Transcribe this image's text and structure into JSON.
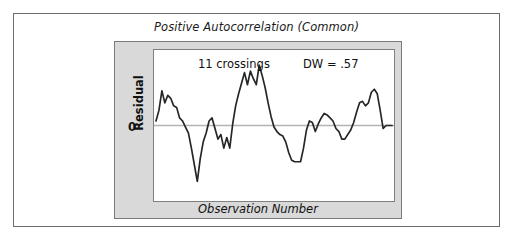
{
  "figure": {
    "title": "Positive Autocorrelation (Common)",
    "colors": {
      "panel_background": "#d9d9d9",
      "plot_background": "#ffffff",
      "frame_border": "#6d6d6d",
      "panel_border": "#7a7a7a",
      "plot_border": "#808080",
      "series_line": "#262626",
      "zero_line": "#b4b4b4",
      "text": "#111111"
    }
  },
  "annotations": {
    "crossings": "11 crossings",
    "durbin_watson": "DW = .57"
  },
  "axes": {
    "ylabel": "Residual",
    "xlabel": "Observation Number",
    "ytick_zero": "0"
  },
  "chart_data": {
    "type": "line",
    "title": "Positive Autocorrelation (Common)",
    "xlabel": "Observation Number",
    "ylabel": "Residual",
    "ytick_labels": [
      "0"
    ],
    "ylim": [
      -1.0,
      1.0
    ],
    "xlim": [
      0,
      80
    ],
    "grid": false,
    "legend": null,
    "zero_reference_line": 0,
    "annotations": [
      "11 crossings",
      "DW = .57"
    ],
    "series": [
      {
        "name": "Residual",
        "x": [
          0,
          1,
          2,
          3,
          4,
          5,
          6,
          7,
          8,
          9,
          10,
          11,
          12,
          13,
          14,
          15,
          16,
          17,
          18,
          19,
          20,
          21,
          22,
          23,
          24,
          25,
          26,
          27,
          28,
          29,
          30,
          31,
          32,
          33,
          34,
          35,
          36,
          37,
          38,
          39,
          40,
          41,
          42,
          43,
          44,
          45,
          46,
          47,
          48,
          49,
          50,
          51,
          52,
          53,
          54,
          55,
          56,
          57,
          58,
          59,
          60,
          61,
          62,
          63,
          64,
          65,
          66,
          67,
          68,
          69,
          70,
          71,
          72,
          73,
          74,
          75,
          76,
          77,
          78,
          79,
          80
        ],
        "values": [
          0.06,
          0.2,
          0.46,
          0.3,
          0.4,
          0.36,
          0.26,
          0.24,
          0.1,
          0.06,
          -0.02,
          -0.1,
          -0.3,
          -0.52,
          -0.74,
          -0.44,
          -0.22,
          -0.1,
          0.06,
          0.1,
          -0.04,
          -0.18,
          -0.12,
          -0.3,
          -0.16,
          -0.3,
          0.02,
          0.26,
          0.42,
          0.56,
          0.7,
          0.54,
          0.72,
          0.62,
          0.54,
          0.8,
          0.66,
          0.5,
          0.3,
          0.12,
          -0.02,
          -0.08,
          -0.12,
          -0.14,
          -0.22,
          -0.36,
          -0.46,
          -0.48,
          -0.48,
          -0.48,
          -0.3,
          -0.06,
          0.06,
          0.04,
          -0.08,
          0.02,
          0.1,
          0.16,
          0.14,
          0.1,
          0.06,
          -0.04,
          -0.08,
          -0.18,
          -0.18,
          -0.12,
          -0.06,
          0.04,
          0.18,
          0.3,
          0.32,
          0.26,
          0.3,
          0.44,
          0.48,
          0.42,
          0.2,
          -0.04,
          0.0,
          0.0,
          0.0
        ],
        "color": "#262626"
      }
    ]
  }
}
